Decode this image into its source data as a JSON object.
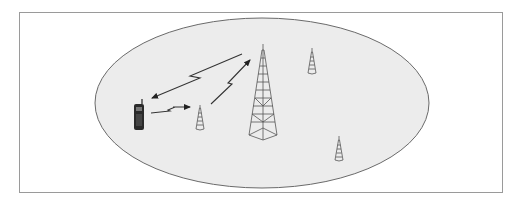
{
  "diagram": {
    "type": "cellular-network-coverage",
    "colors": {
      "frame_border": "#9a9a9a",
      "cell_fill": "#ececec",
      "cell_stroke": "#6a6a6a",
      "tower_stroke": "#555555",
      "signal_stroke": "#333333",
      "phone_fill": "#2a2a2a"
    },
    "nodes": [
      {
        "id": "mobile-phone",
        "kind": "mobile-handset",
        "x": 138,
        "y": 115
      },
      {
        "id": "main-tower",
        "kind": "base-station-tower-large",
        "x": 263,
        "y": 92
      },
      {
        "id": "small-tower-1",
        "kind": "base-station-tower-small",
        "x": 200,
        "y": 118
      },
      {
        "id": "small-tower-2",
        "kind": "base-station-tower-small",
        "x": 312,
        "y": 62
      },
      {
        "id": "small-tower-3",
        "kind": "base-station-tower-small",
        "x": 339,
        "y": 149
      }
    ],
    "links": [
      {
        "from": "main-tower",
        "to": "mobile-phone",
        "style": "lightning-arrow"
      },
      {
        "from": "mobile-phone",
        "to": "small-tower-1",
        "style": "lightning-arrow"
      },
      {
        "from": "small-tower-1",
        "to": "main-tower",
        "style": "lightning-arrow"
      }
    ]
  }
}
